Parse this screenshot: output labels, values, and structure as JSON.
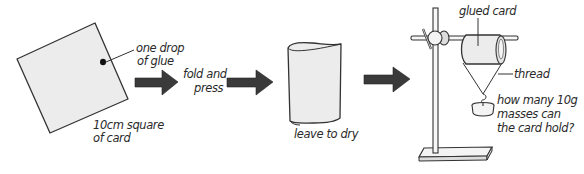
{
  "diagram": {
    "steps": [
      {
        "id": "square",
        "labels": {
          "glue_line1": "one drop",
          "glue_line2": "of glue",
          "card_line1": "10cm square",
          "card_line2": "of card"
        }
      },
      {
        "id": "fold",
        "labels": {
          "line1": "fold and",
          "line2": "press"
        }
      },
      {
        "id": "dry",
        "labels": {
          "line1": "leave to dry"
        }
      },
      {
        "id": "test",
        "labels": {
          "glued_card": "glued card",
          "thread": "thread",
          "question_line1": "how many 10g",
          "question_line2": "masses can",
          "question_line3": "the card hold?"
        }
      }
    ],
    "colors": {
      "arrow": "#3a3a3a",
      "card_fill": "#ececec",
      "line": "#333333",
      "background": "#ffffff"
    }
  }
}
